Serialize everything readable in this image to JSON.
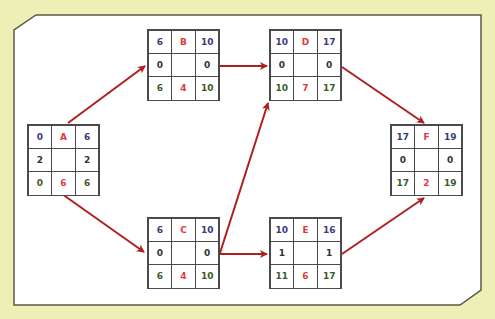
{
  "colors": {
    "background": "#eeefb6",
    "panel": "#ffffff",
    "panel_border": "#5a5a4a",
    "arrow": "#b01e1e",
    "early_time": "#3b3a7a",
    "activity": "#e03a3a",
    "late_time": "#3f5a2a",
    "slack": "#333333"
  },
  "nodes": [
    {
      "id": "A",
      "es": "0",
      "name": "A",
      "ef": "6",
      "slack_left": "2",
      "slack_right": "2",
      "ls": "0",
      "duration": "6",
      "lf": "6",
      "x": 27,
      "y": 124
    },
    {
      "id": "B",
      "es": "6",
      "name": "B",
      "ef": "10",
      "slack_left": "0",
      "slack_right": "0",
      "ls": "6",
      "duration": "4",
      "lf": "10",
      "x": 147,
      "y": 29
    },
    {
      "id": "C",
      "es": "6",
      "name": "C",
      "ef": "10",
      "slack_left": "0",
      "slack_right": "0",
      "ls": "6",
      "duration": "4",
      "lf": "10",
      "x": 147,
      "y": 217
    },
    {
      "id": "D",
      "es": "10",
      "name": "D",
      "ef": "17",
      "slack_left": "0",
      "slack_right": "0",
      "ls": "10",
      "duration": "7",
      "lf": "17",
      "x": 269,
      "y": 29
    },
    {
      "id": "E",
      "es": "10",
      "name": "E",
      "ef": "16",
      "slack_left": "1",
      "slack_right": "1",
      "ls": "11",
      "duration": "6",
      "lf": "17",
      "x": 269,
      "y": 217
    },
    {
      "id": "F",
      "es": "17",
      "name": "F",
      "ef": "19",
      "slack_left": "0",
      "slack_right": "0",
      "ls": "17",
      "duration": "2",
      "lf": "19",
      "x": 390,
      "y": 124
    }
  ],
  "edges": [
    {
      "from": "A",
      "to": "B"
    },
    {
      "from": "A",
      "to": "C"
    },
    {
      "from": "B",
      "to": "D"
    },
    {
      "from": "C",
      "to": "D"
    },
    {
      "from": "C",
      "to": "E"
    },
    {
      "from": "D",
      "to": "F"
    },
    {
      "from": "E",
      "to": "F"
    }
  ]
}
